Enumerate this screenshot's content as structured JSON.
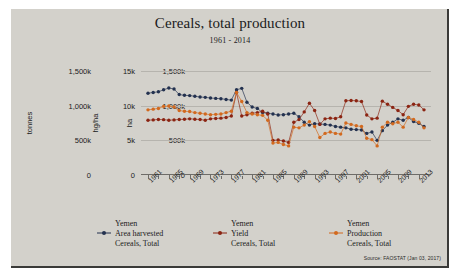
{
  "chart_data": {
    "type": "line",
    "title": "Cereals, total production",
    "subtitle": "1961 - 2014",
    "source": "Source: FAOSTAT (Jan 03, 2017)",
    "xlabel": "",
    "grid": true,
    "legend_position": "bottom",
    "x": [
      1961,
      1962,
      1963,
      1964,
      1965,
      1966,
      1967,
      1968,
      1969,
      1970,
      1971,
      1972,
      1973,
      1974,
      1975,
      1976,
      1977,
      1978,
      1979,
      1980,
      1981,
      1982,
      1983,
      1984,
      1985,
      1986,
      1987,
      1988,
      1989,
      1990,
      1991,
      1992,
      1993,
      1994,
      1995,
      1996,
      1997,
      1998,
      1999,
      2000,
      2001,
      2002,
      2003,
      2004,
      2005,
      2006,
      2007,
      2008,
      2009,
      2010,
      2011,
      2012,
      2013,
      2014
    ],
    "xtick_labels": [
      "1961",
      "1965",
      "1969",
      "1973",
      "1977",
      "1981",
      "1985",
      "1989",
      "1993",
      "1997",
      "2001",
      "2005",
      "2009",
      "2013"
    ],
    "axes": [
      {
        "name": "tonnes",
        "title": "tonnes",
        "tick_labels": [
          "1,500k",
          "1,000k",
          "500k",
          "0"
        ],
        "ylim": [
          0,
          1500000
        ]
      },
      {
        "name": "hg/ha",
        "title": "hg/ha",
        "tick_labels": [
          "15k",
          "10k",
          "5k",
          "0"
        ],
        "ylim": [
          0,
          15000
        ]
      },
      {
        "name": "ha",
        "title": "ha",
        "tick_labels": [
          "1,500k",
          "1,000k",
          "500k",
          "0"
        ],
        "ylim": [
          0,
          1500000
        ]
      }
    ],
    "series": [
      {
        "name": "Yemen Area harvested Cereals, Total",
        "legend_lines": [
          "Yemen",
          "Area harvested",
          "Cereals, Total"
        ],
        "color": "#23314f",
        "axis": "ha",
        "unit": "ha",
        "values": [
          1180000,
          1190000,
          1200000,
          1230000,
          1255000,
          1240000,
          1160000,
          1150000,
          1145000,
          1135000,
          1125000,
          1120000,
          1110000,
          1105000,
          1100000,
          1090000,
          1080000,
          1230000,
          1250000,
          1050000,
          980000,
          960000,
          900000,
          890000,
          880000,
          865000,
          870000,
          880000,
          890000,
          840000,
          760000,
          720000,
          740000,
          735000,
          730000,
          720000,
          700000,
          690000,
          680000,
          660000,
          655000,
          650000,
          600000,
          620000,
          500000,
          640000,
          720000,
          760000,
          810000,
          790000,
          830000,
          770000,
          745000,
          700000
        ]
      },
      {
        "name": "Yemen Yield Cereals, Total",
        "legend_lines": [
          "Yemen",
          "Yield",
          "Cereals, Total"
        ],
        "color": "#8b2412",
        "axis": "hg/ha",
        "unit": "hg/ha",
        "values": [
          7900,
          7950,
          8000,
          7980,
          7900,
          7950,
          8000,
          8050,
          8100,
          8050,
          8000,
          7900,
          8100,
          8150,
          8200,
          8300,
          8500,
          11900,
          8500,
          8700,
          8900,
          9000,
          9200,
          8800,
          5000,
          5050,
          4900,
          4700,
          7600,
          8000,
          9100,
          10350,
          9300,
          7300,
          8100,
          8200,
          8150,
          8400,
          10700,
          10750,
          10700,
          10600,
          8650,
          8100,
          8200,
          10650,
          10200,
          9750,
          9300,
          8700,
          9900,
          10200,
          10100,
          9400
        ]
      },
      {
        "name": "Yemen Production Cereals, Total",
        "legend_lines": [
          "Yemen",
          "Production",
          "Cereals, Total"
        ],
        "color": "#d2691e",
        "axis": "tonnes",
        "unit": "tonnes",
        "values": [
          940000,
          950000,
          960000,
          990000,
          995000,
          980000,
          930000,
          920000,
          915000,
          900000,
          890000,
          880000,
          870000,
          875000,
          880000,
          900000,
          920000,
          1190000,
          1060000,
          900000,
          880000,
          870000,
          860000,
          790000,
          460000,
          470000,
          440000,
          420000,
          690000,
          680000,
          720000,
          770000,
          700000,
          540000,
          600000,
          620000,
          600000,
          590000,
          750000,
          730000,
          710000,
          700000,
          530000,
          510000,
          420000,
          690000,
          760000,
          740000,
          760000,
          690000,
          830000,
          800000,
          760000,
          680000
        ]
      }
    ]
  }
}
